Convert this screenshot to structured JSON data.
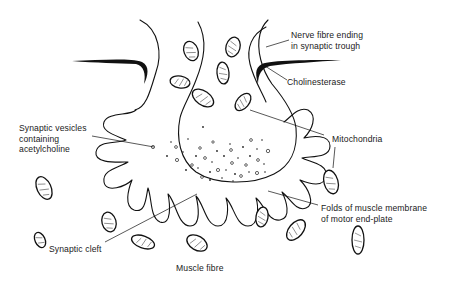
{
  "diagram": {
    "labels": {
      "nerve_fibre": [
        "Nerve fibre ending",
        "in synaptic trough"
      ],
      "cholinesterase": [
        "Cholinesterase"
      ],
      "synaptic_vesicles": [
        "Synaptic vesicles",
        "containing",
        "acetylcholine"
      ],
      "mitochondria": [
        "Mitochondria"
      ],
      "folds": [
        "Folds of muscle membrane",
        "of motor end-plate"
      ],
      "synaptic_cleft": [
        "Synaptic cleft"
      ],
      "muscle_fibre": [
        "Muscle fibre"
      ]
    },
    "colors": {
      "ink": "#111111",
      "background": "#ffffff"
    }
  }
}
